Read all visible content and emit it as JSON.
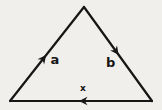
{
  "figure": {
    "kind": "vector-triangle-diagram",
    "background_color": "#f0efeb",
    "ink_color": "#161616",
    "shape": "triangle",
    "sides": [
      {
        "label": "a",
        "position": "left-side",
        "arrow_direction": "up-right toward apex"
      },
      {
        "label": "b",
        "position": "right-side",
        "arrow_direction": "down-right toward bottom-right vertex"
      },
      {
        "label": "x",
        "position": "bottom-side",
        "arrow_direction": "leftward along base"
      }
    ]
  }
}
